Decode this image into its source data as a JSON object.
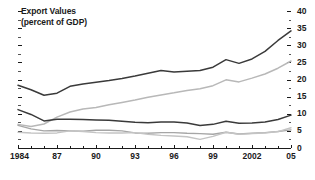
{
  "chart_data": {
    "type": "line",
    "title": "Export Values",
    "subtitle": "(percent of GDP)",
    "xlabel": "",
    "ylabel": "",
    "xlim": [
      1984,
      2005
    ],
    "ylim": [
      0,
      40
    ],
    "ytick_values": [
      0,
      5,
      10,
      15,
      20,
      25,
      30,
      35,
      40
    ],
    "ytick_labels": [
      "0",
      "5",
      "10",
      "15",
      "20",
      "25",
      "30",
      "35",
      "40"
    ],
    "y_axis_position": "right",
    "xtick_values": [
      1984,
      1987,
      1990,
      1993,
      1996,
      1999,
      2002,
      2005
    ],
    "xtick_labels": [
      "1984",
      "87",
      "90",
      "93",
      "96",
      "99",
      "2002",
      "05"
    ],
    "minor_xticks_every": 1,
    "grid": false,
    "legend": "none",
    "x": [
      1984,
      1985,
      1986,
      1987,
      1988,
      1989,
      1990,
      1991,
      1992,
      1993,
      1994,
      1995,
      1996,
      1997,
      1998,
      1999,
      2000,
      2001,
      2002,
      2003,
      2004,
      2005
    ],
    "series": [
      {
        "name": "series-1-dark-upper",
        "color": "#3a3a3a",
        "width": 1.5,
        "values": [
          18.3,
          17.0,
          15.4,
          16.0,
          18.0,
          18.7,
          19.2,
          19.7,
          20.3,
          21.0,
          21.8,
          22.6,
          22.2,
          22.4,
          22.6,
          23.6,
          25.8,
          24.7,
          26.0,
          28.2,
          31.4,
          34.2
        ]
      },
      {
        "name": "series-2-light-rising",
        "color": "#b8b8b8",
        "width": 1.5,
        "values": [
          6.9,
          6.3,
          7.0,
          9.0,
          10.5,
          11.4,
          11.8,
          12.6,
          13.3,
          14.0,
          14.8,
          15.5,
          16.1,
          16.8,
          17.3,
          18.2,
          19.9,
          19.3,
          20.4,
          21.6,
          23.3,
          25.4
        ]
      },
      {
        "name": "series-3-dark-lower",
        "color": "#3a3a3a",
        "width": 1.5,
        "values": [
          11.2,
          9.8,
          7.9,
          8.4,
          8.4,
          8.3,
          8.2,
          8.1,
          7.8,
          7.5,
          7.4,
          7.6,
          7.6,
          7.3,
          6.6,
          6.9,
          7.8,
          7.2,
          7.3,
          7.6,
          8.3,
          9.6
        ]
      },
      {
        "name": "series-4-light-lower-a",
        "color": "#a6a6a6",
        "width": 1.4,
        "values": [
          6.6,
          5.6,
          5.0,
          5.1,
          5.0,
          4.9,
          5.2,
          5.2,
          5.0,
          4.4,
          4.3,
          4.5,
          4.5,
          4.3,
          4.2,
          4.0,
          4.6,
          4.1,
          4.3,
          4.5,
          4.8,
          5.3
        ]
      },
      {
        "name": "series-5-light-lower-b",
        "color": "#c4c4c4",
        "width": 1.4,
        "values": [
          4.6,
          4.4,
          4.3,
          4.4,
          5.0,
          4.8,
          4.5,
          4.4,
          4.4,
          4.5,
          4.0,
          3.7,
          3.5,
          3.3,
          2.5,
          3.4,
          4.6,
          4.0,
          4.2,
          4.4,
          4.8,
          5.9
        ]
      }
    ]
  },
  "axis": {
    "left_tick_marks": 9,
    "right_tick_marks": 9
  }
}
